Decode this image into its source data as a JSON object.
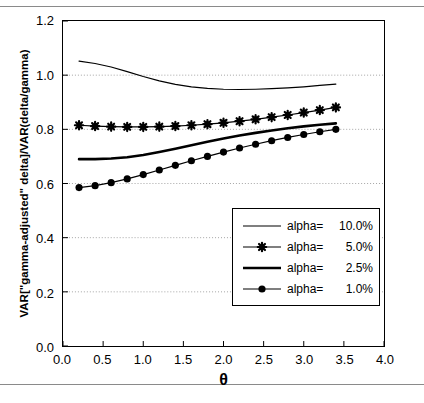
{
  "figure": {
    "x_axis_title": "θ",
    "y_axis_title": "VAR[\"gamma-adjusted\" delta]/VAR(delta/gamma)"
  },
  "chart_data": {
    "type": "line",
    "title": "",
    "xlabel": "θ",
    "ylabel": "VAR[\"gamma-adjusted\" delta]/VAR(delta/gamma)",
    "xlim": [
      0.0,
      4.0
    ],
    "ylim": [
      0.0,
      1.2
    ],
    "xticks": [
      "0.0",
      "0.5",
      "1.0",
      "1.5",
      "2.0",
      "2.5",
      "3.0",
      "3.5",
      "4.0"
    ],
    "xtick_values": [
      0.0,
      0.5,
      1.0,
      1.5,
      2.0,
      2.5,
      3.0,
      3.5,
      4.0
    ],
    "yticks": [
      "0.0",
      "0.2",
      "0.4",
      "0.6",
      "0.8",
      "1.0",
      "1.2"
    ],
    "ytick_values": [
      0.0,
      0.2,
      0.4,
      0.6,
      0.8,
      1.0,
      1.2
    ],
    "grid": "horizontal-dotted",
    "legend_position": "inside-lower-right",
    "x": [
      0.2,
      0.4,
      0.6,
      0.8,
      1.0,
      1.2,
      1.4,
      1.6,
      1.8,
      2.0,
      2.2,
      2.4,
      2.6,
      2.8,
      3.0,
      3.2,
      3.4
    ],
    "series": [
      {
        "name": "alpha= 10.0%",
        "label_name": "alpha=",
        "label_value": "10.0%",
        "marker": "none",
        "line_width": 1.2,
        "color": "#000000",
        "values": [
          1.052,
          1.043,
          1.03,
          1.013,
          0.995,
          0.979,
          0.966,
          0.957,
          0.951,
          0.948,
          0.947,
          0.948,
          0.95,
          0.953,
          0.957,
          0.962,
          0.967
        ]
      },
      {
        "name": "alpha= 5.0%",
        "label_name": "alpha=",
        "label_value": "5.0%",
        "marker": "star",
        "line_width": 1.2,
        "color": "#000000",
        "values": [
          0.815,
          0.812,
          0.81,
          0.809,
          0.809,
          0.81,
          0.812,
          0.815,
          0.819,
          0.824,
          0.83,
          0.837,
          0.845,
          0.853,
          0.862,
          0.871,
          0.881
        ]
      },
      {
        "name": "alpha= 2.5%",
        "label_name": "alpha=",
        "label_value": "2.5%",
        "marker": "none",
        "line_width": 2.6,
        "color": "#000000",
        "values": [
          0.69,
          0.69,
          0.692,
          0.697,
          0.705,
          0.716,
          0.728,
          0.741,
          0.754,
          0.766,
          0.777,
          0.787,
          0.796,
          0.804,
          0.811,
          0.817,
          0.822
        ]
      },
      {
        "name": "alpha= 1.0%",
        "label_name": "alpha=",
        "label_value": "1.0%",
        "marker": "circle",
        "line_width": 1.2,
        "color": "#000000",
        "values": [
          0.585,
          0.592,
          0.603,
          0.617,
          0.633,
          0.65,
          0.667,
          0.684,
          0.7,
          0.716,
          0.731,
          0.745,
          0.758,
          0.77,
          0.781,
          0.791,
          0.8
        ]
      }
    ]
  }
}
